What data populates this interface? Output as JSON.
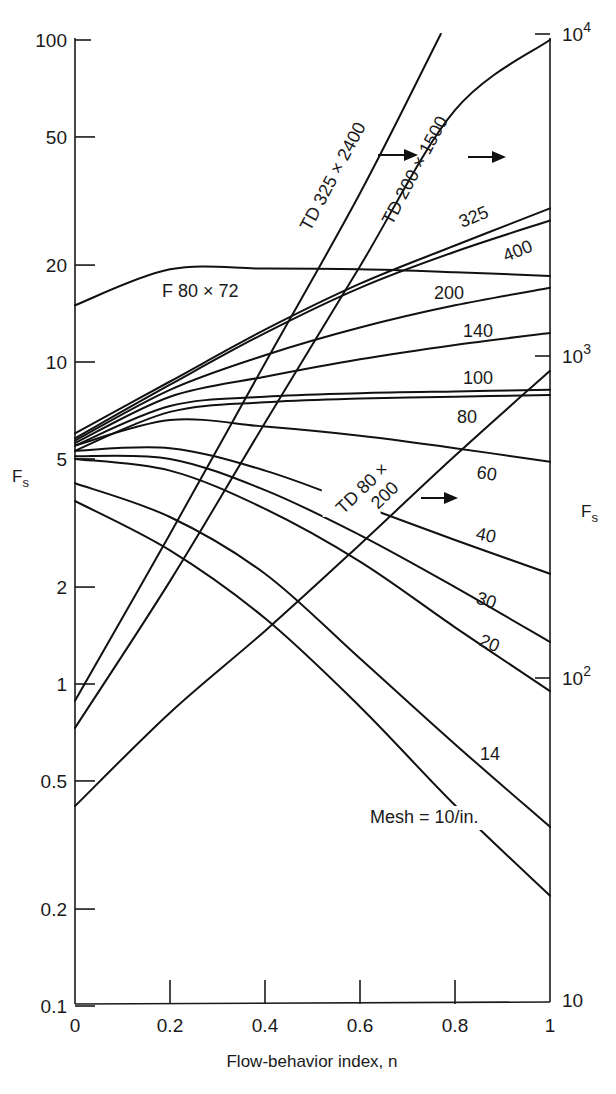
{
  "chart_data": {
    "type": "line",
    "title": "",
    "xlabel": "Flow-behavior index, n",
    "ylabel": "F_s",
    "ylabel_right": "F_s",
    "xlim": [
      0,
      1
    ],
    "ylim": [
      0.1,
      100
    ],
    "ylim_right": [
      10,
      10000
    ],
    "yscale": "log",
    "grid": false,
    "x_ticks": [
      0,
      0.2,
      0.4,
      0.6,
      0.8,
      1
    ],
    "x_tick_labels": [
      "0",
      "0.2",
      "0.4",
      "0.6",
      "0.8",
      "1"
    ],
    "y_ticks": [
      0.1,
      0.2,
      0.5,
      1,
      2,
      5,
      10,
      20,
      50,
      100
    ],
    "y_tick_labels": [
      "0.1",
      "0.2",
      "0.5",
      "1",
      "2",
      "5",
      "10",
      "20",
      "50",
      "100"
    ],
    "y_right_ticks": [
      10,
      100,
      1000,
      10000
    ],
    "y_right_tick_labels": [
      "10",
      "10²",
      "10³",
      "10⁴"
    ],
    "x": [
      0,
      0.2,
      0.4,
      0.6,
      0.8,
      1.0
    ],
    "series": [
      {
        "name": "325",
        "axis": "left",
        "values": [
          6.0,
          8.7,
          12.6,
          17.5,
          23.0,
          30.0
        ]
      },
      {
        "name": "400",
        "axis": "left",
        "values": [
          5.8,
          8.5,
          12.3,
          17.0,
          22.0,
          27.5
        ]
      },
      {
        "name": "200",
        "axis": "left",
        "values": [
          5.7,
          8.2,
          10.5,
          12.8,
          15.0,
          17.0
        ]
      },
      {
        "name": "140",
        "axis": "left",
        "values": [
          5.6,
          7.8,
          9.0,
          10.2,
          11.3,
          12.3
        ]
      },
      {
        "name": "100",
        "axis": "left",
        "values": [
          5.5,
          7.3,
          7.8,
          8.0,
          8.1,
          8.2
        ]
      },
      {
        "name": "80",
        "axis": "left",
        "values": [
          5.3,
          7.0,
          7.5,
          7.7,
          7.8,
          7.9
        ]
      },
      {
        "name": "60",
        "axis": "left",
        "values": [
          5.5,
          6.6,
          6.3,
          5.9,
          5.4,
          4.9
        ]
      },
      {
        "name": "40",
        "axis": "left",
        "values": [
          5.3,
          5.4,
          4.6,
          3.6,
          2.8,
          2.2
        ]
      },
      {
        "name": "30",
        "axis": "left",
        "values": [
          5.1,
          5.0,
          4.0,
          2.9,
          2.0,
          1.35
        ]
      },
      {
        "name": "20",
        "axis": "left",
        "values": [
          5.0,
          4.6,
          3.5,
          2.4,
          1.5,
          0.95
        ]
      },
      {
        "name": "14",
        "axis": "left",
        "values": [
          4.2,
          3.3,
          2.2,
          1.2,
          0.65,
          0.36
        ]
      },
      {
        "name": "Mesh = 10/in.",
        "axis": "left",
        "values": [
          3.7,
          2.6,
          1.6,
          0.85,
          0.42,
          0.22
        ]
      },
      {
        "name": "F 80 × 72",
        "axis": "left",
        "values": [
          15.0,
          19.4,
          19.5,
          19.4,
          19.0,
          18.5
        ]
      },
      {
        "name": "TD 325 × 2400",
        "axis": "right",
        "values": [
          85,
          280,
          950,
          3200,
          null,
          null
        ],
        "end": {
          "n": 0.77,
          "value": 10000
        }
      },
      {
        "name": "TD 200 × 1500",
        "axis": "right",
        "values": [
          70,
          200,
          620,
          1900,
          5800,
          9600
        ]
      },
      {
        "name": "TD 80 × 200",
        "axis": "right",
        "values": [
          40,
          78,
          140,
          260,
          490,
          900
        ]
      }
    ],
    "annotations": [
      {
        "text": "→",
        "meaning": "TD 325 × 2400 reads on right axis"
      },
      {
        "text": "→",
        "meaning": "TD 200 × 1500 reads on right axis"
      },
      {
        "text": "→",
        "meaning": "TD 80 × 200 reads on right axis"
      }
    ]
  },
  "labels": {
    "y_left": "F",
    "y_left_sub": "s",
    "y_right": "F",
    "y_right_sub": "s",
    "x_title": "Flow-behavior index, n",
    "td325": "TD 325 × 2400",
    "td200": "TD 200 × 1500",
    "td80_line1": "TD 80 ×",
    "td80_line2": "200",
    "f80": "F 80 × 72",
    "m325": "325",
    "m400": "400",
    "m200": "200",
    "m140": "140",
    "m100": "100",
    "m80": "80",
    "m60": "60",
    "m40": "40",
    "m30": "30",
    "m20": "20",
    "m14": "14",
    "m10": "Mesh = 10/in."
  }
}
